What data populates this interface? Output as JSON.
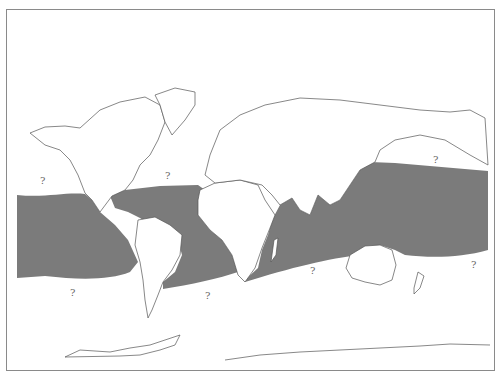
{
  "map": {
    "type": "world-distribution-map",
    "projection": "equirectangular-like",
    "range_fill_color": "#7b7b7b",
    "land_fill_color": "#ffffff",
    "outline_color": "#555555",
    "frame_color": "#8a8a8a",
    "range_description": "Tropical/subtropical oceans: Pacific, Atlantic (incl. Caribbean/Gulf of Mexico), Indian Ocean, western Pacific",
    "uncertainty_markers": [
      {
        "label": "?",
        "x": 42,
        "y": 182
      },
      {
        "label": "?",
        "x": 167,
        "y": 172
      },
      {
        "label": "?",
        "x": 435,
        "y": 155
      },
      {
        "label": "?",
        "x": 72,
        "y": 288
      },
      {
        "label": "?",
        "x": 207,
        "y": 291
      },
      {
        "label": "?",
        "x": 311,
        "y": 266
      },
      {
        "label": "?",
        "x": 472,
        "y": 261
      }
    ]
  }
}
